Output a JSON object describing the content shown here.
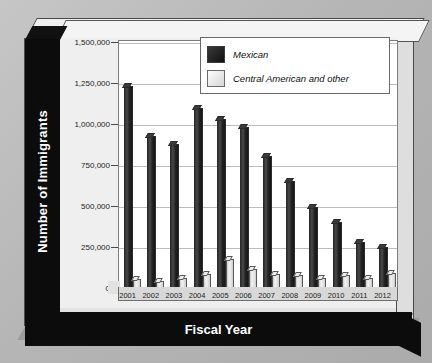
{
  "chart_data": {
    "type": "bar",
    "title": "",
    "xlabel": "Fiscal Year",
    "ylabel": "Number of Immigrants",
    "categories": [
      "2001",
      "2002",
      "2003",
      "2004",
      "2005",
      "2006",
      "2007",
      "2008",
      "2009",
      "2010",
      "2011",
      "2012"
    ],
    "series": [
      {
        "name": "Mexican",
        "color": "#1a1a1a",
        "values": [
          1255000,
          940000,
          895000,
          1115000,
          1050000,
          1000000,
          820000,
          665000,
          505000,
          410000,
          285000,
          255000
        ]
      },
      {
        "name": "Central American and other",
        "color": "#e8e8e8",
        "values": [
          55000,
          45000,
          60000,
          85000,
          180000,
          120000,
          85000,
          80000,
          65000,
          80000,
          65000,
          90000
        ]
      }
    ],
    "ylim": [
      0,
      1500000
    ],
    "yticks": [
      0,
      250000,
      500000,
      750000,
      1000000,
      1250000,
      1500000
    ],
    "ytick_labels": [
      "0",
      "250,000",
      "500,000",
      "750,000",
      "1,000,000",
      "1,250,000",
      "1,500,000"
    ],
    "grid": true,
    "legend_position": "top-right",
    "style": "3d-bar"
  },
  "axis_titles": {
    "y": "Number of Immigrants",
    "x": "Fiscal Year"
  },
  "legend": {
    "entries": [
      {
        "label": "Mexican",
        "swatch": "dark-swatch"
      },
      {
        "label": "Central American and other",
        "swatch": "light-swatch"
      }
    ]
  },
  "colors": {
    "mexican_bar": "#1a1a1a",
    "central_bar": "#e8e8e8",
    "axis_band": "#0c0c0c",
    "plot_background": "#ffffff",
    "page_background": "#b9b9b9"
  }
}
